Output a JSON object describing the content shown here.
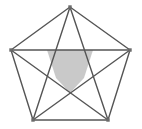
{
  "figure": {
    "shape_name": "pentagon-pentagram",
    "canvas": {
      "width": 142,
      "height": 129,
      "background_color": "#ffffff"
    },
    "colors": {
      "stroke": "#555555",
      "inner_fill": "#c9c9c9",
      "inner_stroke": "#777777",
      "vertex_marker": "#6b6b6b",
      "background": "#ffffff"
    },
    "stroke_width": 1.4,
    "vertex_marker_size": 3.4,
    "outer_pentagon": {
      "name": "outer-pentagon",
      "points": [
        {
          "label": "top",
          "x": 70,
          "y": 7
        },
        {
          "label": "right",
          "x": 130,
          "y": 50
        },
        {
          "label": "bottom-right",
          "x": 108,
          "y": 120
        },
        {
          "label": "bottom-left",
          "x": 33,
          "y": 120
        },
        {
          "label": "left",
          "x": 11,
          "y": 50
        }
      ],
      "points_attr": "70,7 130,50 108,120 33,120 11,50"
    },
    "diagonals": [
      {
        "name": "diagonal-top-to-bottom-right",
        "x1": 70,
        "y1": 7,
        "x2": 108,
        "y2": 120
      },
      {
        "name": "diagonal-top-to-bottom-left",
        "x1": 70,
        "y1": 7,
        "x2": 33,
        "y2": 120
      },
      {
        "name": "diagonal-right-to-bottom-left",
        "x1": 130,
        "y1": 50,
        "x2": 33,
        "y2": 120
      },
      {
        "name": "diagonal-right-to-left",
        "x1": 130,
        "y1": 50,
        "x2": 11,
        "y2": 50
      },
      {
        "name": "diagonal-bottom-right-to-left",
        "x1": 108,
        "y1": 120,
        "x2": 11,
        "y2": 50
      }
    ],
    "inner_pentagon": {
      "name": "inner-pentagon",
      "shaded": true,
      "points": [
        {
          "label": "inner-top-left",
          "x": 47,
          "y": 50
        },
        {
          "label": "inner-top-right",
          "x": 93,
          "y": 50
        },
        {
          "label": "inner-right",
          "x": 84,
          "y": 78
        },
        {
          "label": "inner-bottom",
          "x": 70,
          "y": 93
        },
        {
          "label": "inner-left",
          "x": 56,
          "y": 78
        }
      ],
      "points_attr": "47,50 93,50 84,78 70,93 56,78"
    }
  }
}
